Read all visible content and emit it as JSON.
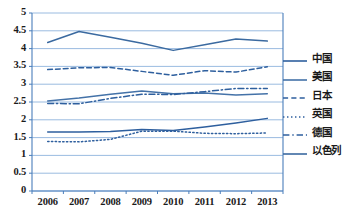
{
  "chart_data": {
    "type": "line",
    "title": "",
    "xlabel": "",
    "ylabel": "",
    "categories": [
      "2006",
      "2007",
      "2008",
      "2009",
      "2010",
      "2011",
      "2012",
      "2013"
    ],
    "ylim": [
      0,
      5
    ],
    "yticks": [
      "0",
      "0.5",
      "1",
      "1.5",
      "2",
      "2.5",
      "3",
      "3.5",
      "4",
      "4.5",
      "5"
    ],
    "ytick_values": [
      0,
      0.5,
      1,
      1.5,
      2,
      2.5,
      3,
      3.5,
      4,
      4.5,
      5
    ],
    "grid": true,
    "legend_position": "right",
    "series": [
      {
        "name": "中国",
        "style": "solid",
        "color": "#2e5f9e",
        "values": [
          1.66,
          1.66,
          1.67,
          1.73,
          1.7,
          1.8,
          1.91,
          2.04
        ]
      },
      {
        "name": "美国",
        "style": "solid",
        "color": "#4472a8",
        "values": [
          2.53,
          2.61,
          2.72,
          2.81,
          2.73,
          2.75,
          2.7,
          2.73
        ]
      },
      {
        "name": "日本",
        "style": "dashed",
        "color": "#2e5f9e",
        "values": [
          3.41,
          3.46,
          3.47,
          3.36,
          3.25,
          3.38,
          3.34,
          3.49
        ]
      },
      {
        "name": "英国",
        "style": "dotted",
        "color": "#2e5f9e",
        "values": [
          1.39,
          1.38,
          1.45,
          1.68,
          1.68,
          1.62,
          1.61,
          1.63
        ]
      },
      {
        "name": "德国",
        "style": "dashdot",
        "color": "#2e5f9e",
        "values": [
          2.46,
          2.45,
          2.6,
          2.72,
          2.71,
          2.79,
          2.88,
          2.88
        ]
      },
      {
        "name": "以色列",
        "style": "solid",
        "color": "#3b6aa0",
        "values": [
          4.17,
          4.48,
          4.32,
          4.15,
          3.95,
          4.11,
          4.27,
          4.21
        ]
      }
    ]
  },
  "axis": {
    "frame_color": "#4a7ebb",
    "grid_color": "#8fb3dd"
  }
}
